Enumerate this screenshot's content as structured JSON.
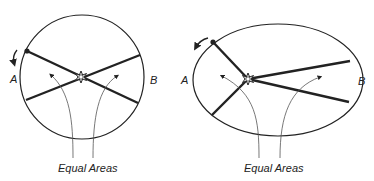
{
  "figures": [
    {
      "id": "circular-orbit",
      "shape": "circle",
      "label_a": "A",
      "label_b": "B",
      "caption": "Equal Areas"
    },
    {
      "id": "elliptical-orbit",
      "shape": "ellipse",
      "label_a": "A",
      "label_b": "B",
      "caption": "Equal Areas"
    }
  ],
  "colors": {
    "stroke": "#222222",
    "thin_stroke": "#555555",
    "background": "#ffffff"
  }
}
